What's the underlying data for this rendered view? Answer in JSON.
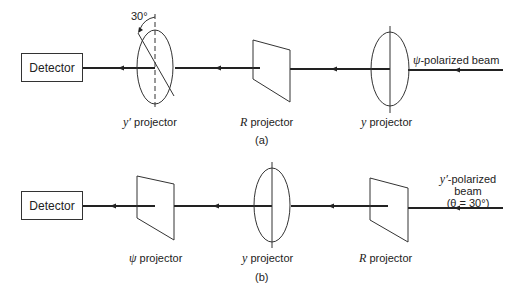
{
  "panel_a": {
    "caption": "(a)",
    "detector": "Detector",
    "angle_label": "30°",
    "projectors": [
      {
        "sym": "y′",
        "text": " projector",
        "shape": "ellipse-rotated"
      },
      {
        "sym": "R",
        "text": " projector",
        "shape": "trapezoid"
      },
      {
        "sym": "y",
        "text": " projector",
        "shape": "ellipse"
      }
    ],
    "beam": {
      "sym": "ψ",
      "text": "-polarized beam"
    }
  },
  "panel_b": {
    "caption": "(b)",
    "detector": "Detector",
    "projectors": [
      {
        "sym": "ψ",
        "text": " projector",
        "shape": "trapezoid"
      },
      {
        "sym": "y",
        "text": " projector",
        "shape": "ellipse"
      },
      {
        "sym": "R",
        "text": " projector",
        "shape": "trapezoid"
      }
    ],
    "beam": {
      "line1_sym": "y′",
      "line1_text": "-polarized",
      "line2": "beam",
      "line3": "(θ = 30°)"
    }
  }
}
